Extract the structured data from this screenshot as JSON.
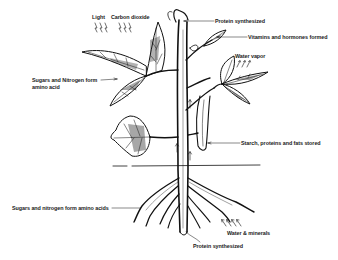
{
  "diagram": {
    "title": "",
    "colors": {
      "ink": "#111111",
      "background": "#ffffff"
    },
    "labels": {
      "light": "Light",
      "carbon_dioxide": "Carbon dioxide",
      "protein_top": "Protein synthesized",
      "vitamins": "Vitamins and hormones formed",
      "water_vapor": "Water vapor",
      "sugars_leaf_line1": "Sugars and Nitrogen form",
      "sugars_leaf_line2": "amino acid",
      "starch": "Starch, proteins and fats stored",
      "sugars_root": "Sugars and nitrogen form amino acids",
      "water_minerals": "Water & minerals",
      "protein_root": "Protein synthesized"
    },
    "components": [
      "stem",
      "leaves",
      "bean pod",
      "soil line",
      "roots",
      "arrows"
    ]
  }
}
